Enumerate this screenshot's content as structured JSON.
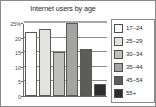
{
  "chart_data": {
    "type": "bar",
    "title": "Internet users by age",
    "xlabel": "",
    "ylabel": "",
    "categories": [
      "17–24",
      "25–29",
      "30–34",
      "35–44",
      "45–54",
      "55+"
    ],
    "values": [
      22,
      23,
      15,
      25,
      16,
      4
    ],
    "ylim": [
      0,
      25
    ],
    "yticks": [
      0,
      5,
      10,
      15,
      20,
      25
    ],
    "ytick_labels": [
      "0",
      "5",
      "10",
      "15",
      "20",
      "25%"
    ],
    "grid": true,
    "legend_position": "right",
    "series": [
      {
        "name": "Internet users by age",
        "values": [
          22,
          23,
          15,
          25,
          16,
          4
        ]
      }
    ],
    "bar_colors": [
      "#ffffff",
      "#e3e3e1",
      "#c0c0be",
      "#a3a3a1",
      "#5c5c5a",
      "#2e2e2d"
    ],
    "legend": [
      {
        "label": "17–24",
        "color": "#ffffff"
      },
      {
        "label": "25–29",
        "color": "#e3e3e1"
      },
      {
        "label": "30–34",
        "color": "#c0c0be"
      },
      {
        "label": "35–44",
        "color": "#a3a3a1"
      },
      {
        "label": "45–54",
        "color": "#5c5c5a"
      },
      {
        "label": "55+",
        "color": "#2e2e2d"
      }
    ]
  }
}
